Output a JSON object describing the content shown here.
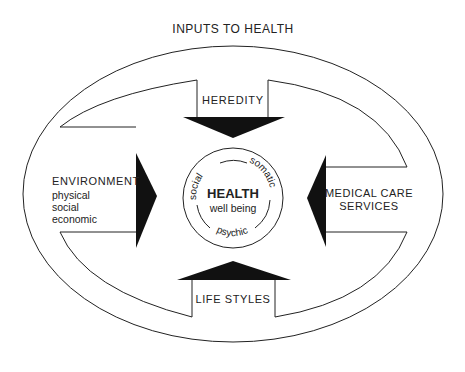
{
  "title": "INPUTS TO HEALTH",
  "center": {
    "title": "HEALTH",
    "subtitle": "well being",
    "arc_labels": [
      "social",
      "somatic",
      "psychic"
    ]
  },
  "inputs": {
    "heredity": {
      "label": "HEREDITY",
      "direction": "down"
    },
    "environment": {
      "label": "ENVIRONMENT",
      "sublabels": [
        "physical",
        "social",
        "economic"
      ],
      "direction": "right"
    },
    "medical_care": {
      "label_lines": [
        "MEDICAL CARE",
        "SERVICES"
      ],
      "direction": "left"
    },
    "life_styles": {
      "label": "LIFE STYLES",
      "direction": "up"
    }
  },
  "colors": {
    "stroke": "#222222",
    "fill_arrow": "#111111",
    "background": "#ffffff"
  }
}
